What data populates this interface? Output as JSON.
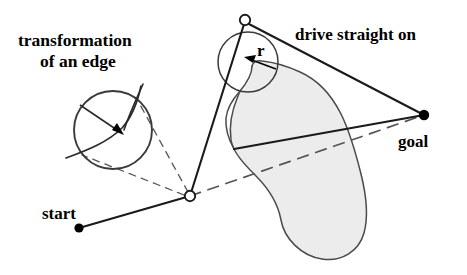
{
  "figure": {
    "kind": "line-drawing-diagram",
    "title_text": null,
    "background_color": "#ffffff",
    "stroke_color": "#1a1a1a",
    "obstacle_fill": "#ececec",
    "obstacle_stroke": "#4a4a4a",
    "circle_stroke": "#3a3a3a",
    "dashed_stroke": "#555555",
    "node_fill_open": "#ffffff",
    "node_fill_solid": "#000000"
  },
  "labels": {
    "transformation": {
      "line1": "transformation",
      "line2": "of an edge",
      "x": 18,
      "y": 46
    },
    "drive_straight_on": {
      "text": "drive straight on",
      "x": 295,
      "y": 40
    },
    "radius": {
      "text": "r",
      "x": 256,
      "y": 55
    },
    "goal": {
      "text": "goal",
      "x": 398,
      "y": 147
    },
    "start": {
      "text": "start",
      "x": 42,
      "y": 219
    }
  },
  "nodes": {
    "start_point": {
      "name": "start",
      "x": 79,
      "y": 228,
      "style": "solid-dot",
      "r": 4.6
    },
    "mid_node": {
      "name": "junction",
      "x": 190,
      "y": 196,
      "style": "open-circle",
      "r": 5.2
    },
    "apex_node": {
      "name": "turn-point",
      "x": 245,
      "y": 20,
      "style": "open-circle",
      "r": 5.2
    },
    "goal_point": {
      "name": "goal",
      "x": 424,
      "y": 115,
      "style": "solid-dot",
      "r": 5.2
    }
  },
  "circles": {
    "edge_transform_circle": {
      "cx": 113,
      "cy": 130,
      "r": 39
    },
    "turn_radius_circle": {
      "cx": 248,
      "cy": 62,
      "r": 30
    }
  },
  "radius_arrows": {
    "edge_arrow": {
      "x1": 81,
      "y1": 106,
      "x2": 123,
      "y2": 134
    },
    "turn_r_arrow": {
      "x1": 274,
      "y1": 68,
      "x2": 246,
      "y2": 58
    }
  },
  "solid_paths": {
    "start_to_mid": {
      "from": "start_point",
      "to": "mid_node"
    },
    "mid_to_apex": {
      "from": "mid_node",
      "to": "apex_node"
    },
    "apex_to_goal": {
      "from": "apex_node",
      "to": "goal_point"
    },
    "obstacle_to_goal": {
      "from": "obstacle_notch",
      "to": "goal_point"
    }
  },
  "dashed_paths": {
    "tangent_upper": {
      "from": "mid_node",
      "to": "edge_circle_upper_tangent"
    },
    "tangent_lower": {
      "from": "mid_node",
      "to": "edge_circle_lower_tangent"
    },
    "mid_to_goal_through_obstacle": {
      "from": "mid_node",
      "to": "goal_point"
    }
  },
  "leader_line": {
    "name": "transformation-leader",
    "from_text": "of an edge",
    "to": "edge_transform_circle"
  },
  "edge_curve": {
    "name": "transformed-edge-curve",
    "description": "curve passing through the transformation circle"
  },
  "obstacle": {
    "name": "obstacle-region",
    "description": "grey grown obstacle blob with concave notch at top",
    "fill": "#ececec"
  }
}
